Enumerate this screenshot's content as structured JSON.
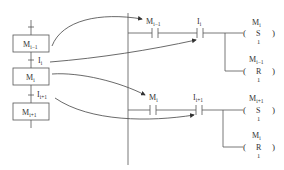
{
  "sfc": {
    "steps": [
      {
        "name": "M",
        "sub": "i−1"
      },
      {
        "name": "M",
        "sub": "i"
      },
      {
        "name": "M",
        "sub": "i+1"
      }
    ],
    "transitions": [
      {
        "name": "I",
        "sub": "i"
      },
      {
        "name": "I",
        "sub": "i+1"
      }
    ]
  },
  "ladder": {
    "rungs": [
      {
        "contact1": {
          "name": "M",
          "sub": "i−1"
        },
        "contact2": {
          "name": "I",
          "sub": "i"
        },
        "set_coil": {
          "name": "M",
          "sub": "i",
          "op": "S",
          "count": "1"
        },
        "reset_coil": {
          "name": "M",
          "sub": "i−1",
          "op": "R",
          "count": "1"
        }
      },
      {
        "contact1": {
          "name": "M",
          "sub": "i"
        },
        "contact2": {
          "name": "I",
          "sub": "i+1"
        },
        "set_coil": {
          "name": "M",
          "sub": "i+1",
          "op": "S",
          "count": "1"
        },
        "reset_coil": {
          "name": "M",
          "sub": "i",
          "op": "R",
          "count": "1"
        }
      }
    ]
  },
  "colors": {
    "line": "#444444",
    "text": "#333333",
    "background": "#ffffff"
  }
}
